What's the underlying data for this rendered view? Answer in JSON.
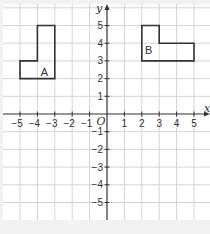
{
  "figure": {
    "type": "coordinate-grid",
    "x_axis": {
      "name": "x",
      "min": -5,
      "max": 5,
      "ticks": [
        "-5",
        "-4",
        "-3",
        "-2",
        "-1",
        "1",
        "2",
        "3",
        "4",
        "5"
      ]
    },
    "y_axis": {
      "name": "y",
      "min": -5,
      "max": 5,
      "ticks": [
        "5",
        "4",
        "3",
        "2",
        "1",
        "-1",
        "-2",
        "-3",
        "-4",
        "-5"
      ]
    },
    "origin_label": "O",
    "shapes": [
      {
        "label": "A",
        "points": [
          [
            -5,
            2
          ],
          [
            -3,
            2
          ],
          [
            -3,
            5
          ],
          [
            -4,
            5
          ],
          [
            -4,
            3
          ],
          [
            -5,
            3
          ]
        ],
        "label_at": [
          -3.6,
          2.4
        ]
      },
      {
        "label": "B",
        "points": [
          [
            2,
            5
          ],
          [
            3,
            5
          ],
          [
            3,
            4
          ],
          [
            5,
            4
          ],
          [
            5,
            3
          ],
          [
            2,
            3
          ]
        ],
        "label_at": [
          2.4,
          3.6
        ]
      }
    ],
    "colors": {
      "grid": "#d4d4d4",
      "axis": "#333333",
      "shape_stroke": "#333333",
      "background": "#f2f2f2",
      "panel": "#ffffff"
    }
  }
}
